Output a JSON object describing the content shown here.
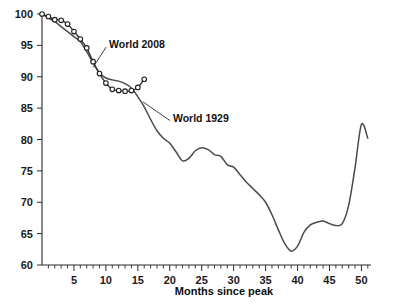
{
  "chart_data": {
    "type": "line",
    "title": "",
    "xlabel": "Months since peak",
    "ylabel": "",
    "xlim": [
      0,
      51.5
    ],
    "ylim": [
      60,
      100
    ],
    "grid": false,
    "legend_position": "inline-annotations",
    "y_ticks": [
      60,
      65,
      70,
      75,
      80,
      85,
      90,
      95,
      100
    ],
    "y_tick_labels": [
      "60",
      "65",
      "70",
      "75",
      "80",
      "85",
      "90",
      "95",
      "100"
    ],
    "x_ticks": [
      5,
      10,
      15,
      20,
      25,
      30,
      35,
      40,
      45,
      50
    ],
    "x_tick_labels": [
      "5",
      "10",
      "15",
      "20",
      "25",
      "30",
      "35",
      "40",
      "45",
      "50"
    ],
    "x_minor_tick_step": 1,
    "annotations": [
      {
        "text": "World 2008",
        "x": 10.5,
        "y": 95.2,
        "anchor_x": 8.0,
        "anchor_y": 91.5
      },
      {
        "text": "World 1929",
        "x": 20.5,
        "y": 83.5,
        "anchor_x": 15.8,
        "anchor_y": 86.0
      }
    ],
    "series": [
      {
        "name": "World 1929",
        "color": "#4a4a4a",
        "markers": false,
        "x": [
          0,
          1,
          2,
          3,
          4,
          5,
          6,
          7,
          8,
          9,
          10,
          11,
          12,
          13,
          14,
          15,
          16,
          17,
          18,
          19,
          20,
          21,
          22,
          23,
          24,
          25,
          26,
          27,
          28,
          29,
          30,
          31,
          32,
          33,
          34,
          35,
          36,
          37,
          38,
          39,
          40,
          41,
          42,
          43,
          44,
          45,
          46,
          47,
          48,
          49,
          50,
          51
        ],
        "values": [
          100.0,
          99.4,
          98.8,
          98.0,
          97.2,
          96.4,
          95.6,
          94.0,
          92.2,
          90.6,
          89.8,
          89.5,
          89.3,
          88.9,
          88.2,
          86.8,
          85.2,
          83.2,
          81.4,
          80.2,
          79.4,
          78.0,
          76.6,
          77.0,
          78.2,
          78.7,
          78.4,
          77.6,
          77.3,
          76.0,
          75.6,
          74.4,
          73.2,
          72.2,
          71.2,
          70.0,
          68.0,
          65.6,
          63.4,
          62.2,
          63.0,
          65.2,
          66.4,
          66.8,
          67.0,
          66.6,
          66.3,
          66.6,
          69.5,
          75.5,
          82.4,
          80.2
        ]
      },
      {
        "name": "World 2008",
        "color": "#2e2e2e",
        "markers": true,
        "x": [
          0,
          1,
          2,
          3,
          4,
          5,
          6,
          7,
          8,
          9,
          10,
          11,
          12,
          13,
          14,
          15,
          16
        ],
        "values": [
          100.0,
          99.6,
          99.1,
          99.0,
          98.4,
          97.2,
          96.0,
          94.6,
          92.4,
          90.5,
          89.0,
          88.0,
          87.8,
          87.7,
          87.8,
          88.3,
          89.6
        ]
      }
    ]
  },
  "axis": {
    "x_title": "Months since peak"
  }
}
